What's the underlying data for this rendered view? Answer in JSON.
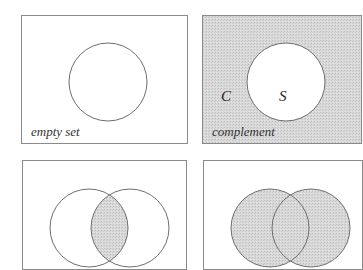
{
  "panels": [
    {
      "id": "empty-set",
      "caption": "empty set",
      "shaded": "none"
    },
    {
      "id": "complement",
      "caption": "complement",
      "shaded": "outside",
      "labels": {
        "outside": "C",
        "inside": "S"
      }
    },
    {
      "id": "intersection",
      "caption": "",
      "shaded": "intersection"
    },
    {
      "id": "union",
      "caption": "",
      "shaded": "union"
    }
  ],
  "colors": {
    "shade": "#d6d6d6",
    "stroke": "#6e6e6e",
    "border": "#8a8a8a",
    "background": "#ffffff"
  }
}
